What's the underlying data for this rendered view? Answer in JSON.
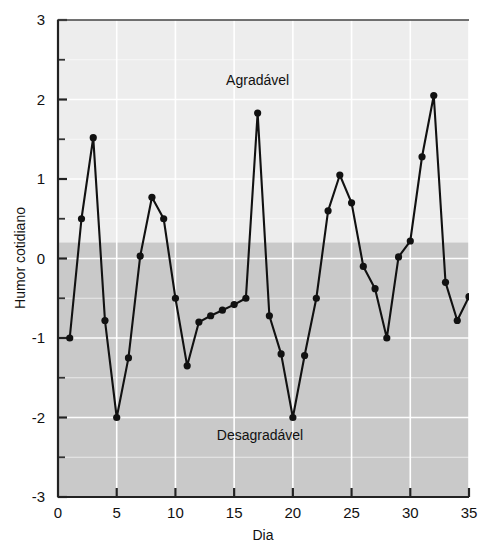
{
  "chart_data": {
    "type": "line",
    "title": "",
    "xlabel": "Dia",
    "ylabel": "Humor cotidiano",
    "xlim": [
      0,
      35
    ],
    "ylim": [
      -3,
      3
    ],
    "grid": true,
    "legend": "none",
    "x_ticks": [
      0,
      5,
      10,
      15,
      20,
      25,
      30,
      35
    ],
    "x_tick_labels": [
      "0",
      "5",
      "10",
      "15",
      "20",
      "25",
      "30",
      "35"
    ],
    "y_ticks": [
      -3,
      -2,
      -1,
      0,
      1,
      2,
      3
    ],
    "y_tick_labels": [
      "-3",
      "-2",
      "-1",
      "0",
      "1",
      "2",
      "3"
    ],
    "y_minor_ticks": [
      -2.5,
      -1.5,
      -0.5,
      0.5,
      1.5,
      2.5
    ],
    "annotations": [
      {
        "text": "Agradável",
        "x": 17.0,
        "y": 2.18
      },
      {
        "text": "Desagradável",
        "x": 17.2,
        "y": -2.28
      }
    ],
    "shaded_band": {
      "from": -3,
      "to": 0.2,
      "color": "#c9c9c9"
    },
    "background_upper_color": "#ededed",
    "marker": "filled-circle",
    "line_color": "#111111",
    "x": [
      1,
      2,
      3,
      4,
      5,
      6,
      7,
      8,
      9,
      10,
      11,
      12,
      13,
      14,
      15,
      16,
      17,
      18,
      19,
      20,
      21,
      22,
      23,
      24,
      25,
      26,
      27,
      28,
      29,
      30,
      31,
      32,
      33,
      34,
      35
    ],
    "values": [
      -1.0,
      0.5,
      1.52,
      -0.78,
      -2.0,
      -1.25,
      0.03,
      0.77,
      0.5,
      -0.5,
      -1.35,
      -0.8,
      -0.72,
      -0.65,
      -0.58,
      -0.5,
      1.83,
      -0.72,
      -1.2,
      -2.0,
      -1.22,
      -0.5,
      0.6,
      1.05,
      0.7,
      -0.1,
      -0.38,
      -1.0,
      0.02,
      0.22,
      1.28,
      2.05,
      -0.3,
      -0.78,
      -0.48
    ],
    "series": [
      {
        "name": "Humor cotidiano",
        "values": [
          -1.0,
          0.5,
          1.52,
          -0.78,
          -2.0,
          -1.25,
          0.03,
          0.77,
          0.5,
          -0.5,
          -1.35,
          -0.8,
          -0.72,
          -0.65,
          -0.58,
          -0.5,
          1.83,
          -0.72,
          -1.2,
          -2.0,
          -1.22,
          -0.5,
          0.6,
          1.05,
          0.7,
          -0.1,
          -0.38,
          -1.0,
          0.02,
          0.22,
          1.28,
          2.05,
          -0.3,
          -0.78,
          -0.48
        ]
      }
    ]
  }
}
